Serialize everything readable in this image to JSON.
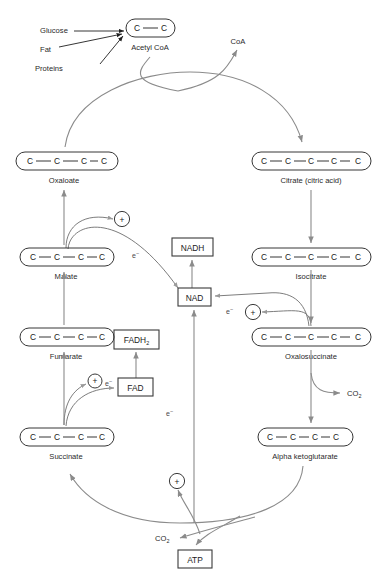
{
  "diagram": {
    "inputs": [
      {
        "id": "glucose",
        "label": "Glucose"
      },
      {
        "id": "fat",
        "label": "Fat"
      },
      {
        "id": "proteins",
        "label": "Proteins"
      }
    ],
    "molecules": [
      {
        "id": "acetyl-coa",
        "label": "Acetyl CoA",
        "carbons": 2
      },
      {
        "id": "oxaloate",
        "label": "Oxaloate",
        "carbons": 4
      },
      {
        "id": "citrate",
        "label": "Citrate (citric acid)",
        "carbons": 6
      },
      {
        "id": "malate",
        "label": "Malate",
        "carbons": 4
      },
      {
        "id": "isocitrate",
        "label": "Isocitrate",
        "carbons": 6
      },
      {
        "id": "fumarate",
        "label": "Fumarate",
        "carbons": 4
      },
      {
        "id": "oxalosuccinate",
        "label": "Oxalosuccinate",
        "carbons": 6
      },
      {
        "id": "succinate",
        "label": "Succinate",
        "carbons": 4
      },
      {
        "id": "alpha-ketoglutarate",
        "label": "Alpha ketoglutarate",
        "carbons": 5
      }
    ],
    "cofactor_boxes": [
      {
        "id": "nadh",
        "label": "NADH"
      },
      {
        "id": "nad",
        "label": "NAD"
      },
      {
        "id": "fadh2",
        "label": "FADH",
        "sub": "2"
      },
      {
        "id": "fad",
        "label": "FAD"
      },
      {
        "id": "atp",
        "label": "ATP"
      }
    ],
    "byproducts": [
      {
        "id": "coa",
        "label": "CoA"
      },
      {
        "id": "co2-right",
        "label": "CO",
        "sub": "2"
      },
      {
        "id": "co2-bottom",
        "label": "CO",
        "sub": "2"
      }
    ],
    "electron_labels": [
      {
        "id": "e-malate",
        "label": "e",
        "sup": "−"
      },
      {
        "id": "e-isocitrate",
        "label": "e",
        "sup": "−"
      },
      {
        "id": "e-succinate",
        "label": "e",
        "sup": "−"
      },
      {
        "id": "e-center",
        "label": "e",
        "sup": "−"
      }
    ],
    "plus_nodes": [
      {
        "id": "plus-malate",
        "label": "+"
      },
      {
        "id": "plus-isocitrate",
        "label": "+"
      },
      {
        "id": "plus-succinate",
        "label": "+"
      },
      {
        "id": "plus-bottom",
        "label": "+"
      }
    ],
    "carbon_symbol": "C",
    "colors": {
      "background": "#ffffff",
      "stroke_dark": "#1f1f1f",
      "stroke_arrow": "#8b8b8b",
      "text": "#1a1a1a"
    }
  }
}
